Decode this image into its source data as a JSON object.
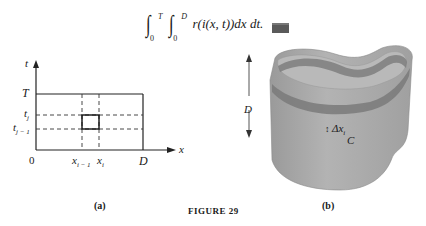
{
  "formula": {
    "outer_upper": "T",
    "outer_lower": "0",
    "inner_upper": "D",
    "inner_lower": "0",
    "integrand": "r(i(x, t))dx dt."
  },
  "panel_a": {
    "caption": "(a)",
    "axis_labels": {
      "vertical": "t",
      "horizontal": "x"
    },
    "t_ticks": [
      "T",
      "t_j",
      "t_{j-1}"
    ],
    "t_tick_text": {
      "T": "T",
      "tj": "t",
      "tj_sub": "j",
      "tj1": "t",
      "tj1_sub": "j − 1"
    },
    "x_ticks": [
      "0",
      "x_{i-1}",
      "x_i",
      "D"
    ],
    "x_tick_text": {
      "origin": "0",
      "xi1": "x",
      "xi1_sub": "i − 1",
      "xi": "x",
      "xi_sub": "i",
      "D": "D"
    }
  },
  "panel_b": {
    "caption": "(b)",
    "height_label": "D",
    "strip_label": "Δx",
    "strip_label_sub": "i",
    "curve_label": "C",
    "surface_color": "#a8a8a8",
    "strip_color": "#7a7a7a"
  },
  "figure_title": "FIGURE 29"
}
